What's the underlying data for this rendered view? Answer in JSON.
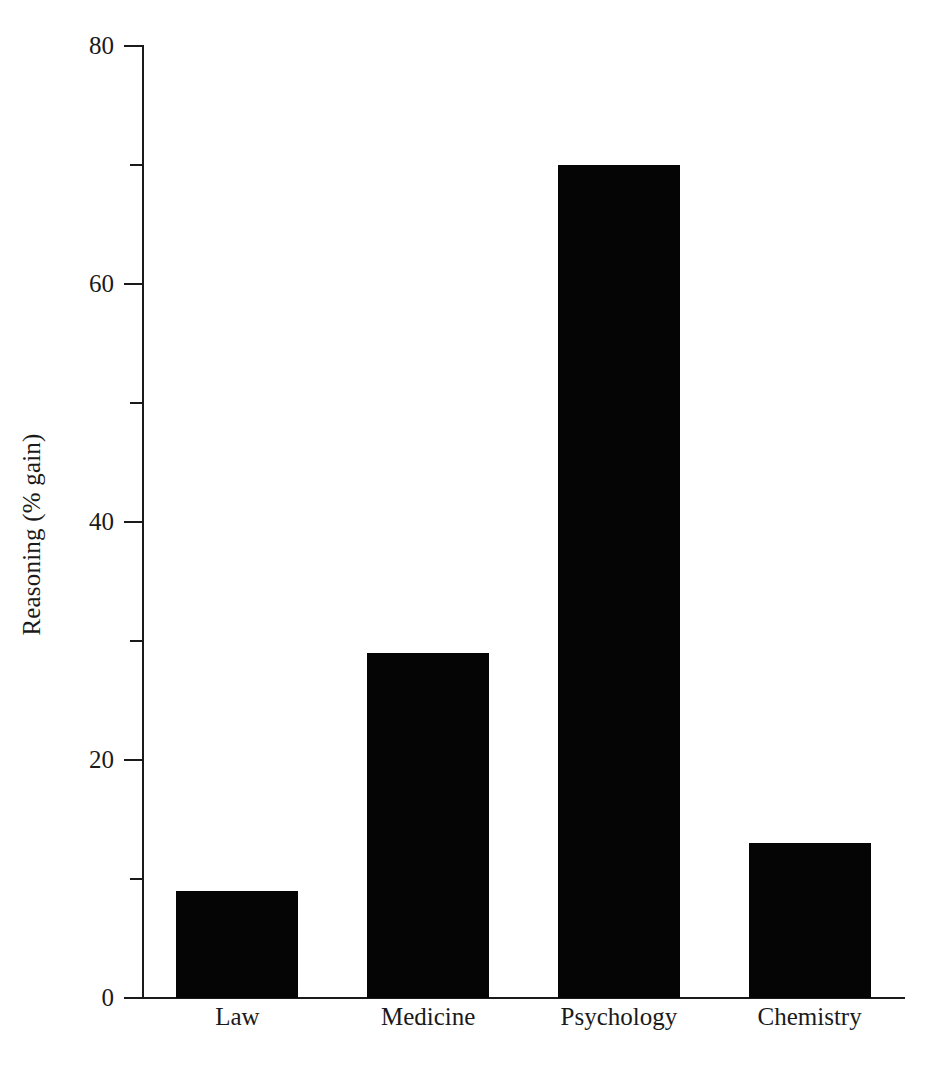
{
  "chart_data": {
    "type": "bar",
    "title": "",
    "subtitle": "",
    "xlabel": "",
    "ylabel": "Reasoning (% gain)",
    "categories": [
      "Law",
      "Medicine",
      "Psychology",
      "Chemistry"
    ],
    "values": [
      9,
      29,
      70,
      13
    ],
    "series": [
      {
        "name": "Reasoning (% gain)",
        "values": [
          9,
          29,
          70,
          13
        ]
      }
    ],
    "ylim": [
      0,
      80
    ],
    "xlim": [
      0,
      4
    ],
    "y_major_ticks": [
      0,
      20,
      40,
      60,
      80
    ],
    "y_major_tick_labels": [
      "0",
      "20",
      "40",
      "60",
      "80"
    ],
    "y_minor_ticks": [
      10,
      30,
      50,
      70
    ],
    "grid": false,
    "legend": false,
    "legend_position": "none",
    "bar_color": "#050505",
    "axis_color": "#1a1a1a",
    "background_color": "#ffffff"
  },
  "axes": {
    "y_title": "Reasoning (% gain)"
  }
}
